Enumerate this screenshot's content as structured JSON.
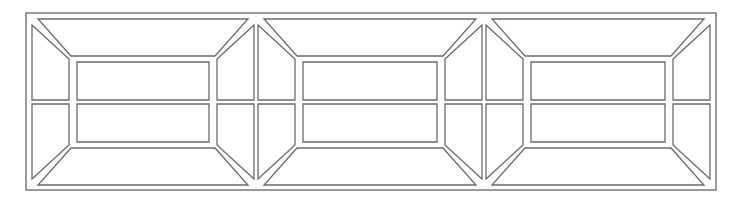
{
  "diagram": {
    "type": "panel-line-drawing",
    "stroke_color": "#6a6a6a",
    "frame_color": "#7a7a7a",
    "background": "#ffffff",
    "outer_frame": {
      "x": 26,
      "y": 13,
      "w": 690,
      "h": 177
    },
    "panels": [
      {
        "id": "panel-1",
        "x0": 32,
        "x1": 254
      },
      {
        "id": "panel-2",
        "x0": 258,
        "x1": 482
      },
      {
        "id": "panel-3",
        "x0": 486,
        "x1": 710
      }
    ],
    "panel_geometry": {
      "top": 19,
      "bottom": 185,
      "inset_x": 41,
      "inner_top": 58,
      "inner_bottom": 146,
      "gap": 4,
      "mid_y": 102
    }
  }
}
